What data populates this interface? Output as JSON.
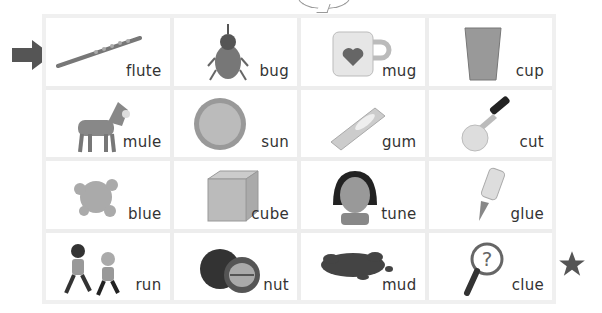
{
  "worksheet": {
    "arrow_icon": "right-arrow-icon",
    "star_icon": "star-icon",
    "bubble_icon": "speech-bubble-icon",
    "colors": {
      "marker": "#555555",
      "grid_line": "#ededed",
      "text": "#333333"
    },
    "cards": [
      {
        "word": "flute",
        "icon": "flute-icon"
      },
      {
        "word": "bug",
        "icon": "beetle-icon"
      },
      {
        "word": "mug",
        "icon": "mug-heart-icon"
      },
      {
        "word": "cup",
        "icon": "cup-icon"
      },
      {
        "word": "mule",
        "icon": "donkey-icon"
      },
      {
        "word": "sun",
        "icon": "sun-icon"
      },
      {
        "word": "gum",
        "icon": "gum-icon"
      },
      {
        "word": "cut",
        "icon": "knife-cut-icon"
      },
      {
        "word": "blue",
        "icon": "paint-splat-icon"
      },
      {
        "word": "cube",
        "icon": "cube-icon"
      },
      {
        "word": "tune",
        "icon": "girl-humming-icon"
      },
      {
        "word": "glue",
        "icon": "glue-bottle-icon"
      },
      {
        "word": "run",
        "icon": "kids-running-icon"
      },
      {
        "word": "nut",
        "icon": "walnut-icon"
      },
      {
        "word": "mud",
        "icon": "mud-puddle-icon"
      },
      {
        "word": "clue",
        "icon": "magnifier-question-icon"
      }
    ]
  }
}
